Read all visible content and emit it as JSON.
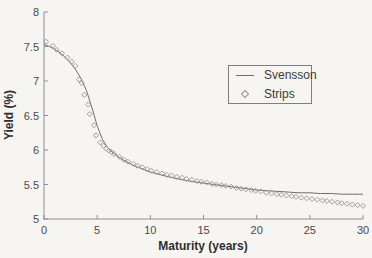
{
  "chart_data": {
    "type": "line",
    "title": "",
    "xlabel": "Maturity (years)",
    "ylabel": "Yield (%)",
    "xlim": [
      0,
      30
    ],
    "ylim": [
      5,
      8
    ],
    "x_ticks": [
      0,
      5,
      10,
      15,
      20,
      25,
      30
    ],
    "y_ticks": [
      5,
      5.5,
      6,
      6.5,
      7,
      7.5,
      8
    ],
    "grid": false,
    "legend_position": "upper-right-inside",
    "series": [
      {
        "name": "Svensson",
        "type": "line",
        "color": "#6f6f6f",
        "points": [
          [
            0,
            7.53
          ],
          [
            0.5,
            7.5
          ],
          [
            1,
            7.46
          ],
          [
            1.5,
            7.41
          ],
          [
            2,
            7.34
          ],
          [
            2.5,
            7.26
          ],
          [
            3,
            7.16
          ],
          [
            3.5,
            7.03
          ],
          [
            4,
            6.86
          ],
          [
            4.5,
            6.62
          ],
          [
            5,
            6.35
          ],
          [
            5.5,
            6.15
          ],
          [
            6,
            6.03
          ],
          [
            6.5,
            5.96
          ],
          [
            7,
            5.9
          ],
          [
            7.5,
            5.85
          ],
          [
            8,
            5.81
          ],
          [
            8.5,
            5.77
          ],
          [
            9,
            5.74
          ],
          [
            9.5,
            5.71
          ],
          [
            10,
            5.68
          ],
          [
            11,
            5.64
          ],
          [
            12,
            5.6
          ],
          [
            13,
            5.57
          ],
          [
            14,
            5.54
          ],
          [
            15,
            5.52
          ],
          [
            16,
            5.5
          ],
          [
            17,
            5.48
          ],
          [
            18,
            5.46
          ],
          [
            19,
            5.44
          ],
          [
            20,
            5.42
          ],
          [
            21,
            5.41
          ],
          [
            22,
            5.4
          ],
          [
            23,
            5.39
          ],
          [
            24,
            5.38
          ],
          [
            25,
            5.38
          ],
          [
            26,
            5.37
          ],
          [
            27,
            5.37
          ],
          [
            28,
            5.36
          ],
          [
            29,
            5.36
          ],
          [
            30,
            5.36
          ]
        ]
      },
      {
        "name": "Strips",
        "type": "scatter",
        "marker": "open-diamond",
        "color": "#949494",
        "points": [
          [
            0.2,
            7.57
          ],
          [
            0.85,
            7.51
          ],
          [
            1.2,
            7.45
          ],
          [
            1.7,
            7.4
          ],
          [
            2.2,
            7.34
          ],
          [
            2.6,
            7.28
          ],
          [
            2.95,
            7.22
          ],
          [
            3.3,
            7.02
          ],
          [
            3.55,
            6.97
          ],
          [
            3.8,
            6.8
          ],
          [
            4.15,
            6.66
          ],
          [
            4.3,
            6.52
          ],
          [
            4.7,
            6.36
          ],
          [
            4.9,
            6.21
          ],
          [
            5.3,
            6.11
          ],
          [
            5.6,
            6.06
          ],
          [
            5.85,
            6.02
          ],
          [
            6.1,
            5.99
          ],
          [
            6.35,
            5.97
          ],
          [
            6.6,
            5.94
          ],
          [
            7.1,
            5.9
          ],
          [
            7.5,
            5.86
          ],
          [
            7.9,
            5.83
          ],
          [
            8.4,
            5.8
          ],
          [
            8.8,
            5.77
          ],
          [
            9.25,
            5.75
          ],
          [
            9.7,
            5.72
          ],
          [
            10.1,
            5.7
          ],
          [
            10.6,
            5.68
          ],
          [
            11.1,
            5.66
          ],
          [
            11.55,
            5.64
          ],
          [
            12,
            5.63
          ],
          [
            12.5,
            5.61
          ],
          [
            13,
            5.6
          ],
          [
            13.4,
            5.58
          ],
          [
            13.9,
            5.57
          ],
          [
            14.4,
            5.55
          ],
          [
            14.8,
            5.54
          ],
          [
            15.3,
            5.53
          ],
          [
            15.8,
            5.51
          ],
          [
            16.2,
            5.5
          ],
          [
            16.7,
            5.49
          ],
          [
            17.1,
            5.48
          ],
          [
            17.6,
            5.47
          ],
          [
            18.1,
            5.45
          ],
          [
            18.55,
            5.44
          ],
          [
            19,
            5.43
          ],
          [
            19.5,
            5.42
          ],
          [
            19.9,
            5.41
          ],
          [
            20.4,
            5.4
          ],
          [
            20.9,
            5.38
          ],
          [
            21.4,
            5.37
          ],
          [
            21.9,
            5.36
          ],
          [
            22.3,
            5.35
          ],
          [
            22.8,
            5.34
          ],
          [
            23.3,
            5.33
          ],
          [
            23.7,
            5.32
          ],
          [
            24.2,
            5.31
          ],
          [
            24.7,
            5.3
          ],
          [
            25.2,
            5.29
          ],
          [
            25.7,
            5.28
          ],
          [
            26.2,
            5.27
          ],
          [
            26.6,
            5.26
          ],
          [
            27.1,
            5.25
          ],
          [
            27.6,
            5.24
          ],
          [
            28,
            5.23
          ],
          [
            28.5,
            5.22
          ],
          [
            29,
            5.21
          ],
          [
            29.5,
            5.2
          ],
          [
            30,
            5.19
          ]
        ]
      }
    ]
  },
  "colors": {
    "background": "#f6f5f1",
    "axis": "#8f8f8f",
    "tick_label": "#4a4a4a",
    "axis_title": "#2e2e2e",
    "line": "#6f6f6f",
    "marker": "#949494"
  }
}
